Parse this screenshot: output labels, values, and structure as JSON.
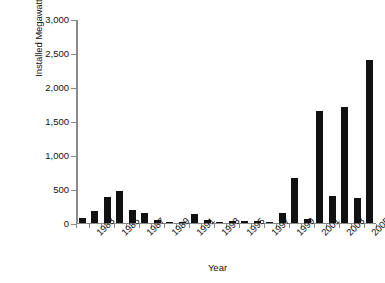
{
  "chart_data": {
    "type": "bar",
    "title": "",
    "xlabel": "Year",
    "ylabel": "Installed Megawatts (net)",
    "ylim": [
      0,
      3000
    ],
    "ytick_labels": [
      "0",
      "500",
      "1,000",
      "1,500",
      "2,000",
      "2,500",
      "3,000"
    ],
    "ytick_values": [
      0,
      500,
      1000,
      1500,
      2000,
      2500,
      3000
    ],
    "grid": false,
    "legend": false,
    "bar_color": "#111111",
    "axis_color": "#8a8a8a",
    "categories": [
      "1982",
      "1983",
      "1984",
      "1985",
      "1986",
      "1987",
      "1988",
      "1989",
      "1990",
      "1991",
      "1992",
      "1993",
      "1994",
      "1995",
      "1996",
      "1997",
      "1998",
      "1999",
      "2000",
      "2001",
      "2002",
      "2003",
      "2004",
      "2005"
    ],
    "visible_xtick_labels": [
      "1983",
      "1985",
      "1987",
      "1989",
      "1991",
      "1993",
      "1995",
      "1997",
      "1999",
      "2001",
      "2003",
      "2005"
    ],
    "values": [
      75,
      175,
      380,
      470,
      190,
      145,
      40,
      15,
      5,
      130,
      40,
      5,
      25,
      25,
      30,
      5,
      140,
      660,
      60,
      1650,
      400,
      1700,
      360,
      2400
    ]
  }
}
